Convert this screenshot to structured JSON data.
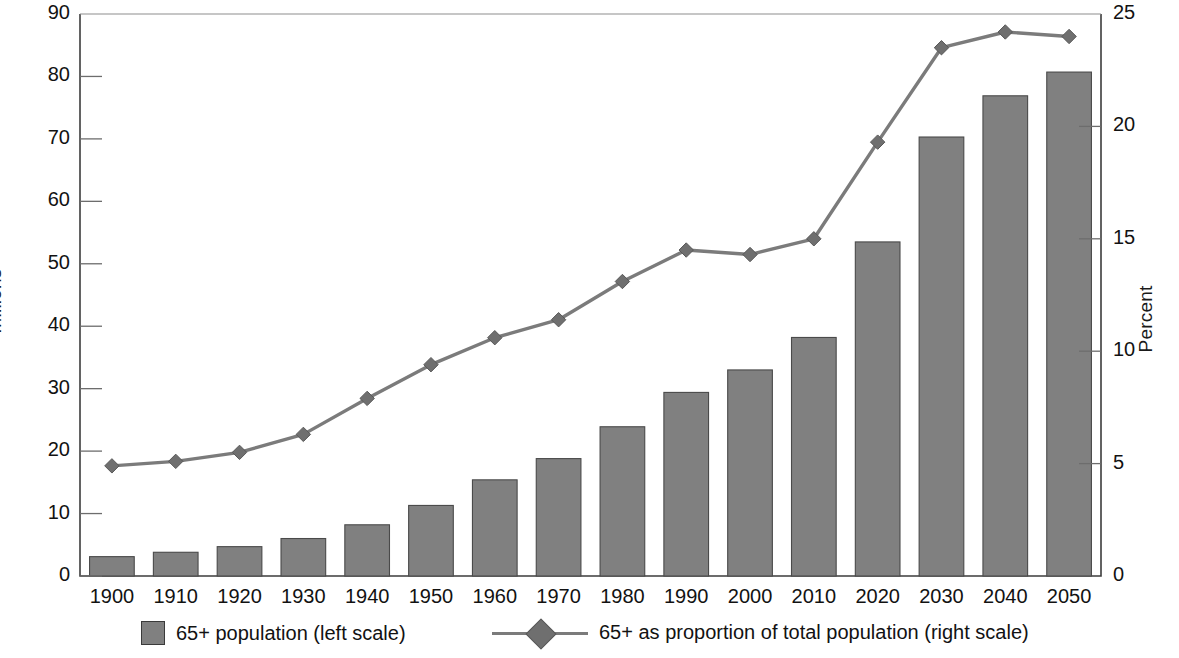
{
  "chart_data": {
    "type": "bar",
    "title": "",
    "categories": [
      "1900",
      "1910",
      "1920",
      "1930",
      "1940",
      "1950",
      "1960",
      "1970",
      "1980",
      "1990",
      "2000",
      "2010",
      "2020",
      "2030",
      "2040",
      "2050"
    ],
    "xlabel": "",
    "series": [
      {
        "name": "65+ population (left scale)",
        "type": "bar",
        "axis": "left",
        "unit": "Millions",
        "color": "#808080",
        "values": [
          3.1,
          3.8,
          4.7,
          6.0,
          8.2,
          11.3,
          15.4,
          18.8,
          23.9,
          29.4,
          33.0,
          38.2,
          53.5,
          70.3,
          76.9,
          80.7
        ]
      },
      {
        "name": "65+ as proportion of total population (right scale)",
        "type": "line",
        "axis": "right",
        "unit": "Percent",
        "color": "#7b7b7b",
        "marker": "diamond",
        "values": [
          4.9,
          5.1,
          5.5,
          6.3,
          7.9,
          9.4,
          10.6,
          11.4,
          13.1,
          14.5,
          14.3,
          15.0,
          19.3,
          23.5,
          24.2,
          24.0
        ]
      }
    ],
    "left_axis": {
      "label": "Millions",
      "min": 0,
      "max": 90,
      "step": 10,
      "ticks": [
        "0",
        "10",
        "20",
        "30",
        "40",
        "50",
        "60",
        "70",
        "80",
        "90"
      ]
    },
    "right_axis": {
      "label": "Percent",
      "min": 0,
      "max": 25,
      "step": 5,
      "ticks": [
        "0",
        "5",
        "10",
        "15",
        "20",
        "25"
      ]
    },
    "grid": false,
    "legend_position": "bottom"
  },
  "legend": {
    "bar_label": "65+ population (left scale)",
    "line_label": "65+ as proportion of total population (right scale)"
  },
  "axis_titles": {
    "left": "Millions",
    "right": "Percent"
  },
  "top_partial_text": ""
}
